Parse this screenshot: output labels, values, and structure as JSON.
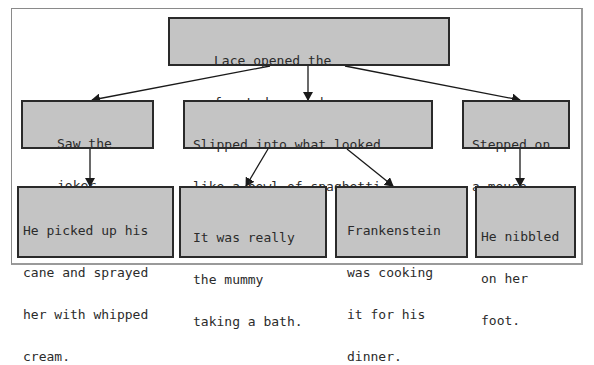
{
  "diagram": {
    "colors": {
      "box_fill": "#c4c4c4",
      "box_border": "#2a2a2a",
      "text": "#2b2b2b",
      "arrow": "#1a1a1a",
      "frame": "#8a8a8a"
    },
    "nodes": {
      "root": {
        "lines": [
          "Lace opened the",
          "front door and . . ."
        ]
      },
      "a": {
        "lines": [
          "Saw the",
          "joker."
        ]
      },
      "b": {
        "lines": [
          "Slipped into what looked",
          "like a bowl of spaghetti."
        ]
      },
      "c": {
        "lines": [
          "Stepped on",
          "a mouse."
        ]
      },
      "a1": {
        "lines": [
          "He picked up his",
          "cane and sprayed",
          "her with whipped",
          "cream."
        ]
      },
      "b1": {
        "lines": [
          "It was really",
          "the mummy",
          "taking a bath."
        ]
      },
      "b2": {
        "lines": [
          "Frankenstein",
          "was cooking",
          "it for his",
          "dinner."
        ]
      },
      "c1": {
        "lines": [
          "He nibbled",
          "on her",
          "foot."
        ]
      }
    },
    "edges": [
      {
        "from": "root",
        "to": "a"
      },
      {
        "from": "root",
        "to": "b"
      },
      {
        "from": "root",
        "to": "c"
      },
      {
        "from": "a",
        "to": "a1"
      },
      {
        "from": "b",
        "to": "b1"
      },
      {
        "from": "b",
        "to": "b2"
      },
      {
        "from": "c",
        "to": "c1"
      }
    ]
  }
}
